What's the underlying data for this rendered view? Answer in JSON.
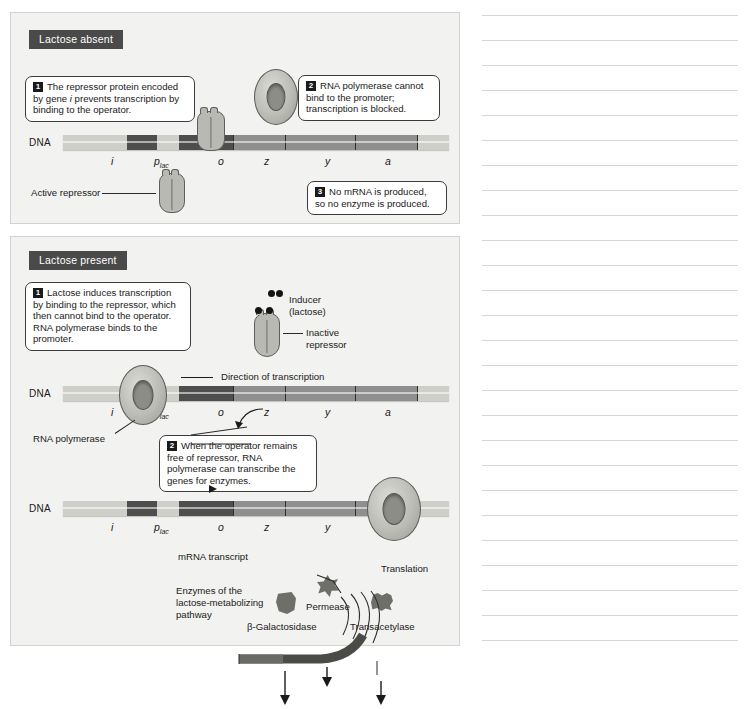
{
  "figure": {
    "panels": [
      {
        "id": "lactose-absent",
        "title": "Lactose absent",
        "dna_label": "DNA",
        "genes": [
          "i",
          "p",
          "o",
          "z",
          "y",
          "a"
        ],
        "promoter_sub": "lac",
        "callouts": [
          {
            "number": "1",
            "text_before": "The repressor protein encoded by gene ",
            "gene": "i",
            "text_after": " prevents transcription by binding to the operator."
          },
          {
            "number": "2",
            "text": "RNA polymerase cannot bind to the promoter; transcription is blocked."
          },
          {
            "number": "3",
            "text": "No mRNA is produced, so no enzyme is produced."
          }
        ],
        "labels": [
          {
            "name": "active-repressor",
            "text": "Active repressor"
          }
        ]
      },
      {
        "id": "lactose-present",
        "title": "Lactose present",
        "dna_label": "DNA",
        "genes": [
          "i",
          "p",
          "o",
          "z",
          "y",
          "a"
        ],
        "promoter_sub": "lac",
        "callouts": [
          {
            "number": "1",
            "text": "Lactose induces transcription by binding to the repressor, which then cannot bind to the operator. RNA polymerase binds to the promoter."
          },
          {
            "number": "2",
            "text": "When the operator remains free of repressor, RNA polymerase can transcribe the genes for enzymes."
          }
        ],
        "labels": [
          {
            "name": "inducer",
            "line1": "Inducer",
            "line2": "(lactose)"
          },
          {
            "name": "inactive-repressor",
            "line1": "Inactive",
            "line2": "repressor"
          },
          {
            "name": "direction-of-transcription",
            "text": "Direction of transcription"
          },
          {
            "name": "rna-polymerase",
            "text": "RNA polymerase"
          },
          {
            "name": "mrna-transcript",
            "text": "mRNA transcript"
          },
          {
            "name": "translation",
            "text": "Translation"
          },
          {
            "name": "enzymes-pathway",
            "line1": "Enzymes of the",
            "line2": "lactose-metabolizing",
            "line3": "pathway"
          },
          {
            "name": "beta-galactosidase",
            "text": "β-Galactosidase"
          },
          {
            "name": "permease",
            "text": "Permease"
          },
          {
            "name": "transacetylase",
            "text": "Transacetylase"
          }
        ]
      }
    ]
  },
  "notes": {
    "line_count": 26,
    "rule_color": "#d6d6d6"
  },
  "colors": {
    "panel_background": "#f2f2f0",
    "panel_border": "#d2d2ce",
    "title_background": "#4a4a4a",
    "title_text": "#ffffff",
    "dna_dark": "#4e4e4e",
    "dna_mid": "#8f8f8f",
    "dna_light": "#cfcfca",
    "protein_fill": "#b9b9b4",
    "ink": "#1a1a1a"
  }
}
